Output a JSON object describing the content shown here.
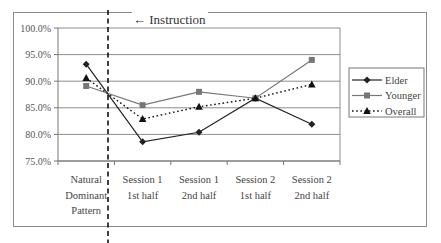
{
  "chart_data": {
    "type": "line",
    "title": "",
    "xlabel": "",
    "ylabel": "",
    "ylim": [
      75.0,
      100.0
    ],
    "yticks": [
      "75.0%",
      "80.0%",
      "85.0%",
      "90.0%",
      "95.0%",
      "100.0%"
    ],
    "grid": true,
    "legend_position": "right",
    "categories": [
      [
        "Natural",
        "Dominant",
        "Pattern"
      ],
      [
        "Session 1",
        "1st half"
      ],
      [
        "Session 1",
        "2nd half"
      ],
      [
        "Session 2",
        "1st half"
      ],
      [
        "Session 2",
        "2nd half"
      ]
    ],
    "series": [
      {
        "name": "Elder",
        "marker": "diamond",
        "line": "solid",
        "color": "#222222",
        "values": [
          93.2,
          78.6,
          80.4,
          86.8,
          81.9
        ]
      },
      {
        "name": "Younger",
        "marker": "square",
        "line": "solid",
        "color": "#777777",
        "values": [
          89.1,
          85.5,
          88.0,
          86.8,
          94.0
        ]
      },
      {
        "name": "Overall",
        "marker": "triangle",
        "line": "dotted",
        "color": "#111111",
        "values": [
          90.6,
          82.9,
          85.2,
          86.8,
          89.4
        ]
      }
    ],
    "annotations": [
      {
        "text": "← Instruction",
        "type": "dashed-vertical-line",
        "position": "between Natural Dominant Pattern and Session 1 1st half"
      }
    ]
  }
}
